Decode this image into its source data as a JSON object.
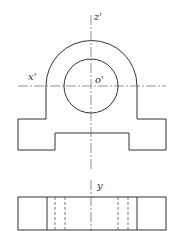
{
  "diagram": {
    "type": "orthographic-projection",
    "views": [
      "front-view",
      "top-view"
    ],
    "labels": {
      "z_axis": "z'",
      "x_axis": "x'",
      "origin": "o'",
      "y_axis": "y"
    },
    "colors": {
      "line": "#333333",
      "background": "#ffffff"
    }
  }
}
